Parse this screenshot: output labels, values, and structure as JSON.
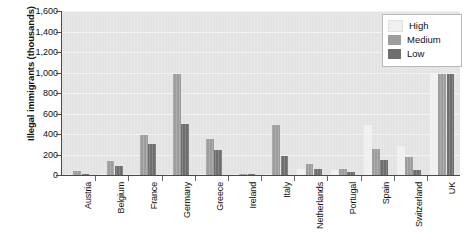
{
  "chart_data": {
    "type": "bar",
    "title": "",
    "subtitle": "",
    "xlabel": "",
    "ylabel": "Illegal immigrants (thousands)",
    "ylim": [
      0,
      1600
    ],
    "ytick_values": [
      0,
      200,
      400,
      600,
      800,
      1000,
      1200,
      1400,
      1600
    ],
    "ytick_labels": [
      "0",
      "200",
      "400",
      "600",
      "800",
      "1,000",
      "1,200",
      "1,400",
      "1,600"
    ],
    "grid": true,
    "legend_position": "top-right",
    "categories": [
      "Austria",
      "Belgium",
      "France",
      "Germany",
      "Greece",
      "Ireland",
      "Italy",
      "Netherlands",
      "Portugal",
      "Spain",
      "Switzerland",
      "UK"
    ],
    "series": [
      {
        "name": "High",
        "color": "#f0f0f0",
        "values": [
          5,
          10,
          10,
          10,
          10,
          5,
          10,
          55,
          45,
          490,
          285,
          990
        ]
      },
      {
        "name": "Medium",
        "color": "#9d9d9d",
        "values": [
          40,
          140,
          390,
          990,
          350,
          8,
          490,
          110,
          55,
          255,
          180,
          990
        ]
      },
      {
        "name": "Low",
        "color": "#6e6e6e",
        "values": [
          10,
          90,
          300,
          495,
          245,
          8,
          190,
          60,
          25,
          145,
          45,
          990
        ]
      }
    ]
  },
  "legend": {
    "items": [
      {
        "label": "High",
        "color": "#f0f0f0"
      },
      {
        "label": "Medium",
        "color": "#9d9d9d"
      },
      {
        "label": "Low",
        "color": "#6e6e6e"
      }
    ]
  },
  "colors": {
    "plot_background": "#e3e3e3",
    "gridline": "#f2f2f2",
    "axis": "#4a4a4a",
    "text": "#111111",
    "page_background": "#ffffff"
  }
}
